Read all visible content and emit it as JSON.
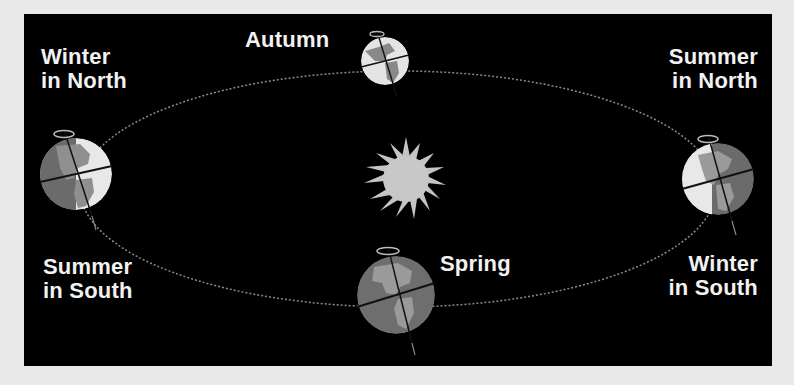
{
  "diagram": {
    "colors": {
      "background": "#000000",
      "frame": "#e9e9e9",
      "text": "#f2f2f2",
      "orbit": "#8a8a8a",
      "sun": "#c8c8c8",
      "globe_light": "#e6e6e6",
      "globe_dark": "#6a6a6a",
      "globe_land": "#9a9a9a"
    },
    "labels": {
      "top_left": {
        "line1": "Winter",
        "line2": "in North"
      },
      "top_center": {
        "line1": "Autumn"
      },
      "top_right": {
        "line1": "Summer",
        "line2": "in North"
      },
      "bottom_left": {
        "line1": "Summer",
        "line2": "in South"
      },
      "bottom_center": {
        "line1": "Spring"
      },
      "bottom_right": {
        "line1": "Winter",
        "line2": "in South"
      }
    },
    "icons": {
      "sun": "sun-icon",
      "earth": "earth-globe-icon",
      "rotation": "rotation-arrow-icon",
      "orbit": "orbit-ellipse"
    }
  }
}
